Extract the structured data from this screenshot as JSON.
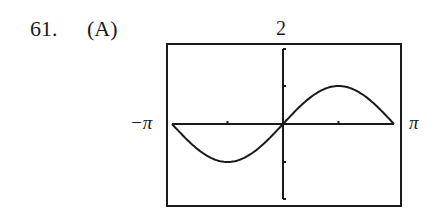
{
  "problem": {
    "number": "61.",
    "choice": "(A)"
  },
  "window": {
    "ymax_label": "2",
    "xmin_label": "−π",
    "xmax_label": "π"
  },
  "chart_data": {
    "type": "line",
    "title": "",
    "xlabel": "",
    "ylabel": "",
    "function": "y = sin(x)",
    "xlim": [
      -3.14159,
      3.14159
    ],
    "ylim": [
      -2,
      2
    ],
    "x_tick_labels": [
      "-π",
      "π"
    ],
    "y_tick_labels": [
      "2"
    ],
    "x_ticks": [
      -1.5708,
      1.5708
    ],
    "y_ticks": [
      -1,
      1
    ],
    "grid": false,
    "series": [
      {
        "name": "sin(x)",
        "x": [
          -3.1416,
          -2.3562,
          -1.5708,
          -0.7854,
          0,
          0.7854,
          1.5708,
          2.3562,
          3.1416
        ],
        "values": [
          0,
          -0.7071,
          -1,
          -0.7071,
          0,
          0.7071,
          1,
          0.7071,
          0
        ]
      }
    ]
  }
}
